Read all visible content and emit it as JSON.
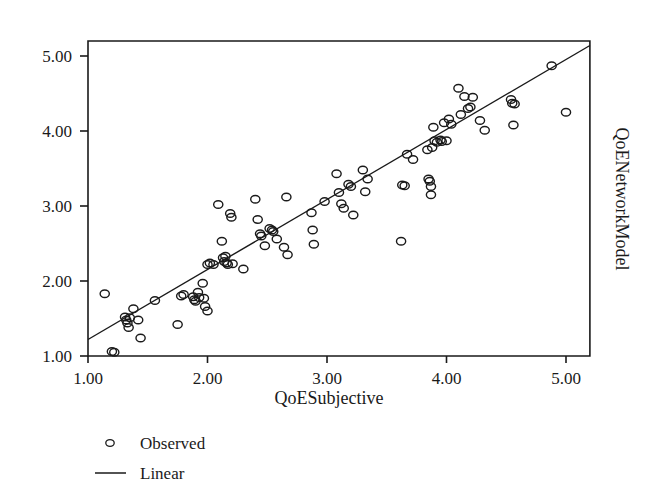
{
  "chart_data": {
    "type": "scatter",
    "title": "",
    "xlabel": "QoESubjective",
    "ylabel": "QoENetworkModel",
    "xlim": [
      1.0,
      5.2
    ],
    "ylim": [
      1.0,
      5.2
    ],
    "xticks": [
      "1.00",
      "2.00",
      "3.00",
      "4.00",
      "5.00"
    ],
    "xtick_values": [
      1.0,
      2.0,
      3.0,
      4.0,
      5.0
    ],
    "yticks": [
      "1.00",
      "2.00",
      "3.00",
      "4.00",
      "5.00"
    ],
    "ytick_values": [
      1.0,
      2.0,
      3.0,
      4.0,
      5.0
    ],
    "grid": false,
    "legend_position": "below-left",
    "ylabel_position": "right-rotated",
    "series": [
      {
        "name": "Observed",
        "marker": "open-circle",
        "color": "#1a1a1a",
        "points": [
          [
            1.14,
            1.83
          ],
          [
            1.2,
            1.06
          ],
          [
            1.22,
            1.05
          ],
          [
            1.31,
            1.52
          ],
          [
            1.32,
            1.48
          ],
          [
            1.33,
            1.44
          ],
          [
            1.34,
            1.38
          ],
          [
            1.35,
            1.51
          ],
          [
            1.38,
            1.63
          ],
          [
            1.42,
            1.48
          ],
          [
            1.44,
            1.24
          ],
          [
            1.56,
            1.74
          ],
          [
            1.75,
            1.42
          ],
          [
            1.78,
            1.8
          ],
          [
            1.8,
            1.82
          ],
          [
            1.88,
            1.79
          ],
          [
            1.89,
            1.75
          ],
          [
            1.9,
            1.73
          ],
          [
            1.92,
            1.85
          ],
          [
            1.93,
            1.78
          ],
          [
            1.96,
            1.97
          ],
          [
            1.97,
            1.77
          ],
          [
            1.98,
            1.66
          ],
          [
            2.0,
            1.6
          ],
          [
            2.0,
            2.22
          ],
          [
            2.02,
            2.24
          ],
          [
            2.05,
            2.22
          ],
          [
            2.09,
            3.02
          ],
          [
            2.12,
            2.53
          ],
          [
            2.13,
            2.31
          ],
          [
            2.14,
            2.26
          ],
          [
            2.15,
            2.33
          ],
          [
            2.16,
            2.24
          ],
          [
            2.17,
            2.22
          ],
          [
            2.19,
            2.9
          ],
          [
            2.2,
            2.85
          ],
          [
            2.21,
            2.23
          ],
          [
            2.3,
            2.16
          ],
          [
            2.4,
            3.09
          ],
          [
            2.42,
            2.82
          ],
          [
            2.44,
            2.63
          ],
          [
            2.45,
            2.6
          ],
          [
            2.48,
            2.47
          ],
          [
            2.52,
            2.7
          ],
          [
            2.54,
            2.68
          ],
          [
            2.55,
            2.66
          ],
          [
            2.58,
            2.56
          ],
          [
            2.64,
            2.45
          ],
          [
            2.66,
            3.12
          ],
          [
            2.67,
            2.35
          ],
          [
            2.87,
            2.91
          ],
          [
            2.88,
            2.68
          ],
          [
            2.89,
            2.49
          ],
          [
            2.98,
            3.06
          ],
          [
            3.08,
            3.43
          ],
          [
            3.1,
            3.18
          ],
          [
            3.12,
            3.03
          ],
          [
            3.14,
            2.97
          ],
          [
            3.18,
            3.29
          ],
          [
            3.2,
            3.26
          ],
          [
            3.22,
            2.88
          ],
          [
            3.3,
            3.48
          ],
          [
            3.32,
            3.19
          ],
          [
            3.34,
            3.36
          ],
          [
            3.62,
            2.53
          ],
          [
            3.63,
            3.28
          ],
          [
            3.65,
            3.27
          ],
          [
            3.67,
            3.69
          ],
          [
            3.72,
            3.62
          ],
          [
            3.84,
            3.75
          ],
          [
            3.85,
            3.36
          ],
          [
            3.86,
            3.33
          ],
          [
            3.87,
            3.26
          ],
          [
            3.87,
            3.15
          ],
          [
            3.88,
            3.78
          ],
          [
            3.89,
            4.05
          ],
          [
            3.9,
            3.87
          ],
          [
            3.92,
            3.85
          ],
          [
            3.95,
            3.88
          ],
          [
            3.96,
            3.86
          ],
          [
            3.98,
            4.11
          ],
          [
            4.0,
            3.87
          ],
          [
            4.02,
            4.16
          ],
          [
            4.04,
            4.09
          ],
          [
            4.1,
            4.57
          ],
          [
            4.12,
            4.22
          ],
          [
            4.15,
            4.46
          ],
          [
            4.18,
            4.3
          ],
          [
            4.2,
            4.32
          ],
          [
            4.22,
            4.45
          ],
          [
            4.28,
            4.14
          ],
          [
            4.32,
            4.01
          ],
          [
            4.54,
            4.42
          ],
          [
            4.55,
            4.37
          ],
          [
            4.56,
            4.08
          ],
          [
            4.57,
            4.36
          ],
          [
            4.88,
            4.87
          ],
          [
            5.0,
            4.25
          ]
        ]
      }
    ],
    "fit_line": {
      "name": "Linear",
      "x_start": 1.0,
      "y_start": 1.22,
      "x_end": 5.2,
      "y_end": 5.14,
      "slope": 0.9333,
      "intercept": 0.2867
    },
    "legend": [
      {
        "label": "Observed",
        "marker": "open-circle"
      },
      {
        "label": "Linear",
        "marker": "line"
      }
    ]
  }
}
